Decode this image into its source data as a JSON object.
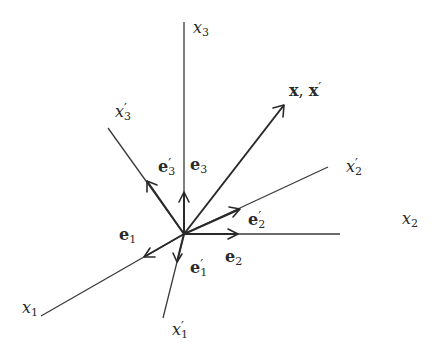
{
  "diagram": {
    "colors": {
      "line": "#3a3a3a",
      "text": "#2a2a2a",
      "background": "#ffffff"
    },
    "axes": {
      "x1": {
        "base": "x",
        "sub": "1",
        "prime": false
      },
      "x2": {
        "base": "x",
        "sub": "2",
        "prime": false
      },
      "x3": {
        "base": "x",
        "sub": "3",
        "prime": false
      },
      "x1p": {
        "base": "x",
        "sub": "1",
        "prime": true
      },
      "x2p": {
        "base": "x",
        "sub": "2",
        "prime": true
      },
      "x3p": {
        "base": "x",
        "sub": "3",
        "prime": true
      }
    },
    "unit_vectors": {
      "e1": {
        "base": "e",
        "sub": "1",
        "prime": false
      },
      "e2": {
        "base": "e",
        "sub": "2",
        "prime": false
      },
      "e3": {
        "base": "e",
        "sub": "3",
        "prime": false
      },
      "e1p": {
        "base": "e",
        "sub": "1",
        "prime": true
      },
      "e2p": {
        "base": "e",
        "sub": "2",
        "prime": true
      },
      "e3p": {
        "base": "e",
        "sub": "3",
        "prime": true
      }
    },
    "vector": {
      "label_a": "x",
      "separator": ", ",
      "label_b": "x",
      "prime": "′"
    },
    "prime_symbol": "′"
  }
}
